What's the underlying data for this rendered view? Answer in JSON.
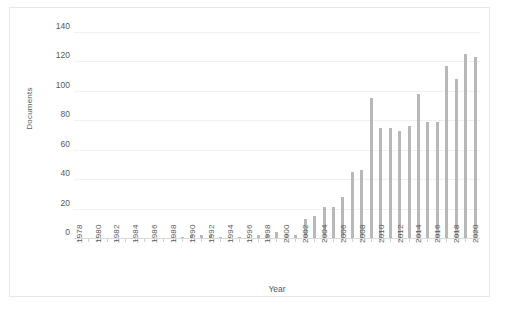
{
  "chart_data": {
    "type": "bar",
    "title": "",
    "xlabel": "Year",
    "ylabel": "Documents",
    "ylim": [
      0,
      140
    ],
    "yticks": [
      0,
      20,
      40,
      60,
      80,
      100,
      120,
      140
    ],
    "grid": true,
    "legend": "none",
    "bar_color": "#b8b8b8",
    "gridline_color": "#f0f0f0",
    "x_label_interval": 2,
    "categories": [
      "1978",
      "1979",
      "1980",
      "1981",
      "1982",
      "1983",
      "1984",
      "1985",
      "1986",
      "1987",
      "1988",
      "1989",
      "1990",
      "1991",
      "1992",
      "1993",
      "1994",
      "1995",
      "1996",
      "1997",
      "1998",
      "1999",
      "2000",
      "2001",
      "2002",
      "2003",
      "2004",
      "2005",
      "2006",
      "2007",
      "2008",
      "2009",
      "2010",
      "2011",
      "2012",
      "2013",
      "2014",
      "2015",
      "2016",
      "2017",
      "2018",
      "2019",
      "2020"
    ],
    "values": [
      1,
      0,
      1,
      0,
      0,
      0,
      0,
      0,
      0,
      0,
      1,
      1,
      2,
      2,
      2,
      1,
      1,
      1,
      1,
      2,
      3,
      4,
      3,
      2,
      13,
      15,
      21,
      21,
      28,
      45,
      46,
      95,
      75,
      75,
      73,
      76,
      98,
      79,
      79,
      117,
      108,
      125,
      123
    ],
    "x_tick_labels": [
      "1978",
      "",
      "1980",
      "",
      "1982",
      "",
      "1984",
      "",
      "1986",
      "",
      "1988",
      "",
      "1990",
      "",
      "1992",
      "",
      "1994",
      "",
      "1996",
      "",
      "1998",
      "",
      "2000",
      "",
      "2002",
      "",
      "2004",
      "",
      "2006",
      "",
      "2008",
      "",
      "2010",
      "",
      "2012",
      "",
      "2014",
      "",
      "2016",
      "",
      "2018",
      "",
      "2020"
    ]
  }
}
